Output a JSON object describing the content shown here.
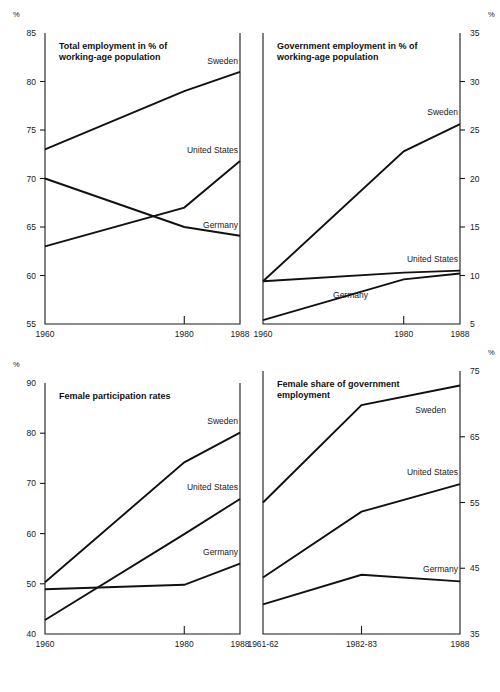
{
  "figure": {
    "unit_symbol": "%"
  },
  "chart_data": [
    {
      "id": "total-employment",
      "type": "line",
      "title": "Total employment in % of working-age population",
      "title_lines": [
        "Total employment in % of",
        "working-age population"
      ],
      "xlabel": "",
      "ylabel": "%",
      "x": [
        1960,
        1980,
        1988
      ],
      "tick_labels_x": [
        "1960",
        "1980",
        "1988"
      ],
      "xlim": [
        1960,
        1988
      ],
      "ylim": [
        55,
        85
      ],
      "yticks": [
        55,
        60,
        65,
        70,
        75,
        80,
        85
      ],
      "tick_labels_y": [
        "55",
        "60",
        "65",
        "70",
        "75",
        "80",
        "85"
      ],
      "y_axis_side": "left",
      "grid": false,
      "legend": "inline-right",
      "series": [
        {
          "name": "Sweden",
          "values": [
            73.0,
            79.0,
            81.0
          ]
        },
        {
          "name": "United States",
          "values": [
            63.0,
            67.0,
            71.8
          ]
        },
        {
          "name": "Germany",
          "values": [
            70.0,
            65.0,
            64.1
          ]
        }
      ]
    },
    {
      "id": "government-employment",
      "type": "line",
      "title": "Government employment in % of working-age population",
      "title_lines": [
        "Government employment in % of",
        "working-age population"
      ],
      "xlabel": "",
      "ylabel": "%",
      "x": [
        1960,
        1980,
        1988
      ],
      "tick_labels_x": [
        "1960",
        "1980",
        "1988"
      ],
      "xlim": [
        1960,
        1988
      ],
      "ylim": [
        5,
        35
      ],
      "yticks": [
        5,
        10,
        15,
        20,
        25,
        30,
        35
      ],
      "tick_labels_y": [
        "5",
        "10",
        "15",
        "20",
        "25",
        "30",
        "35"
      ],
      "y_axis_side": "right",
      "grid": false,
      "legend": "inline-right",
      "series": [
        {
          "name": "Sweden",
          "values": [
            9.4,
            22.8,
            25.6
          ]
        },
        {
          "name": "United States",
          "values": [
            9.4,
            10.3,
            10.5
          ]
        },
        {
          "name": "Germany",
          "values": [
            5.4,
            9.6,
            10.2
          ]
        }
      ]
    },
    {
      "id": "female-participation",
      "type": "line",
      "title": "Female participation rates",
      "title_lines": [
        "Female participation rates"
      ],
      "xlabel": "",
      "ylabel": "%",
      "x": [
        1960,
        1980,
        1988
      ],
      "tick_labels_x": [
        "1960",
        "1980",
        "1988"
      ],
      "xlim": [
        1960,
        1988
      ],
      "ylim": [
        40,
        90
      ],
      "yticks": [
        40,
        50,
        60,
        70,
        80,
        90
      ],
      "tick_labels_y": [
        "40",
        "50",
        "60",
        "70",
        "80",
        "90"
      ],
      "y_axis_side": "left",
      "grid": false,
      "legend": "inline-right",
      "series": [
        {
          "name": "Sweden",
          "values": [
            50.3,
            74.2,
            80.1
          ]
        },
        {
          "name": "United States",
          "values": [
            42.8,
            59.9,
            66.9
          ]
        },
        {
          "name": "Germany",
          "values": [
            48.9,
            49.8,
            54.0
          ]
        }
      ]
    },
    {
      "id": "female-share-government",
      "type": "line",
      "title": "Female share of government employment",
      "title_lines": [
        "Female share of government",
        "employment"
      ],
      "xlabel": "",
      "ylabel": "%",
      "x": [
        0,
        1,
        2
      ],
      "tick_labels_x": [
        "1961-62",
        "1982-83",
        "1988"
      ],
      "xlim": [
        0,
        2
      ],
      "ylim": [
        35,
        75
      ],
      "yticks": [
        35,
        45,
        55,
        65,
        75
      ],
      "tick_labels_y": [
        "35",
        "45",
        "55",
        "65",
        "75"
      ],
      "y_axis_side": "right",
      "grid": false,
      "legend": "inline-right",
      "series": [
        {
          "name": "Sweden",
          "values": [
            55.0,
            69.8,
            72.8
          ]
        },
        {
          "name": "United States",
          "values": [
            43.6,
            53.6,
            57.8
          ]
        },
        {
          "name": "Germany",
          "values": [
            39.5,
            44.0,
            43.0
          ]
        }
      ]
    }
  ]
}
